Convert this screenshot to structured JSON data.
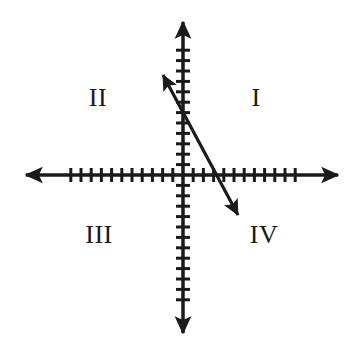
{
  "figure": {
    "type": "coordinate-plane-diagram",
    "width": 360,
    "height": 355,
    "background_color": "#ffffff",
    "stroke_color": "#1a1a1a"
  },
  "axes": {
    "origin": {
      "x": 183,
      "y": 175
    },
    "x_axis": {
      "name": "horizontal-axis",
      "start_x": 26,
      "end_x": 338,
      "y": 175,
      "stroke_width": 3.5,
      "arrow_both_ends": true,
      "tick_count_left": 11,
      "tick_count_right": 11,
      "tick_spacing": 10.2,
      "tick_half_length": 7,
      "tick_stroke_width": 3
    },
    "y_axis": {
      "name": "vertical-axis",
      "start_y": 22,
      "end_y": 333,
      "x": 183,
      "stroke_width": 3.5,
      "arrow_both_ends": true,
      "tick_count_up": 12,
      "tick_count_down": 12,
      "tick_spacing": 10.4,
      "tick_half_length": 7,
      "tick_stroke_width": 3
    }
  },
  "line": {
    "name": "negative-slope-line",
    "description": "Double-headed arrow line with negative slope crossing quadrant II into quadrant IV",
    "start": {
      "x": 163,
      "y": 75
    },
    "end": {
      "x": 238,
      "y": 215
    },
    "stroke_width": 3.2,
    "arrow_both_ends": true,
    "x_intercept_px": {
      "x": 204,
      "y": 175
    },
    "y_intercept_px": {
      "x": 183,
      "y": 135
    },
    "slope_sign": "negative"
  },
  "quadrant_labels": [
    {
      "label": "I",
      "name": "quadrant-label-i",
      "x": 256,
      "y": 98
    },
    {
      "label": "II",
      "name": "quadrant-label-ii",
      "x": 98,
      "y": 98
    },
    {
      "label": "III",
      "name": "quadrant-label-iii",
      "x": 99,
      "y": 235
    },
    {
      "label": "IV",
      "name": "quadrant-label-iv",
      "x": 264,
      "y": 235
    }
  ],
  "chart_data": {
    "type": "line",
    "title": "",
    "xlabel": "",
    "ylabel": "",
    "grid": false,
    "legend": false,
    "annotations": [
      "I",
      "II",
      "III",
      "IV"
    ],
    "series": [
      {
        "name": "negative-slope-line",
        "x": [
          -2,
          2
        ],
        "y": [
          5,
          -2
        ],
        "slope": -1.75,
        "intercept": 1.5
      }
    ],
    "xlim": [
      -11,
      11
    ],
    "ylim": [
      -12,
      12
    ],
    "xticks": [
      -11,
      -10,
      -9,
      -8,
      -7,
      -6,
      -5,
      -4,
      -3,
      -2,
      -1,
      1,
      2,
      3,
      4,
      5,
      6,
      7,
      8,
      9,
      10,
      11
    ],
    "yticks": [
      -12,
      -11,
      -10,
      -9,
      -8,
      -7,
      -6,
      -5,
      -4,
      -3,
      -2,
      -1,
      1,
      2,
      3,
      4,
      5,
      6,
      7,
      8,
      9,
      10,
      11,
      12
    ],
    "xticklabels": [],
    "yticklabels": []
  }
}
